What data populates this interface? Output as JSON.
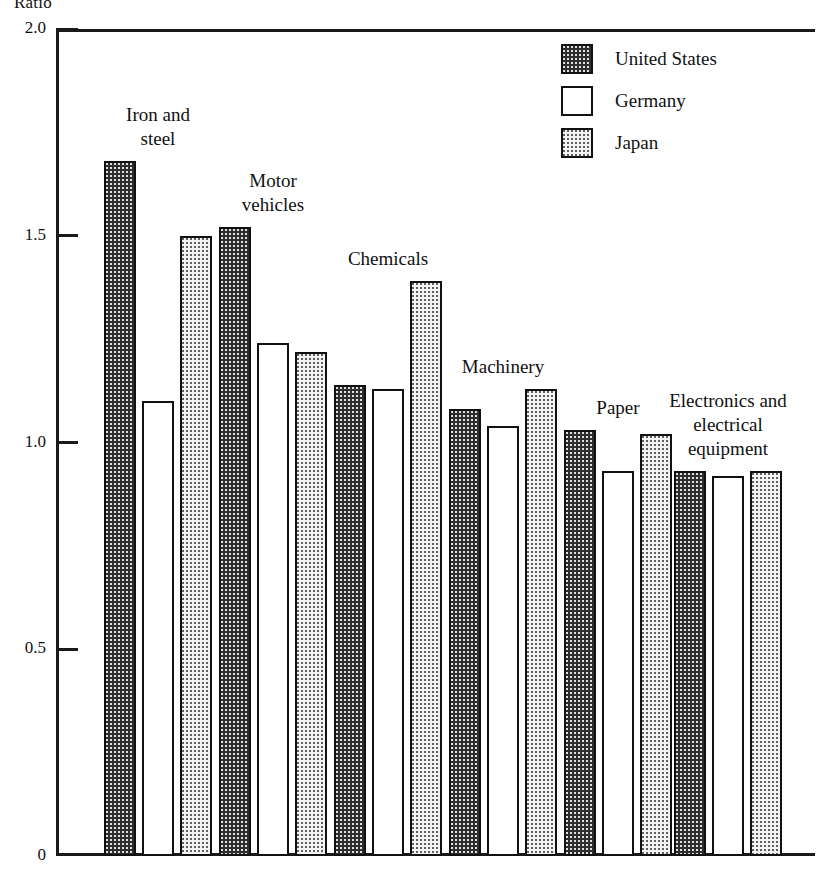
{
  "chart_data": {
    "type": "bar",
    "title": "",
    "ylabel": "Ratio",
    "xlabel": "",
    "ylim": [
      0,
      2.0
    ],
    "grid": false,
    "legend_position": "top-right",
    "y_ticks": [
      "2.0",
      "1.5",
      "1.0",
      "0.5",
      "0"
    ],
    "y_tick_values": [
      2.0,
      1.5,
      1.0,
      0.5,
      0
    ],
    "categories": [
      "Iron and\nsteel",
      "Motor\nvehicles",
      "Chemicals",
      "Machinery",
      "Paper",
      "Electronics and\nelectrical\nequipment"
    ],
    "series": [
      {
        "name": "United States",
        "values": [
          1.68,
          1.52,
          1.14,
          1.08,
          1.03,
          0.93
        ]
      },
      {
        "name": "Germany",
        "values": [
          1.1,
          1.24,
          1.13,
          1.04,
          0.93,
          0.92
        ]
      },
      {
        "name": "Japan",
        "values": [
          1.5,
          1.22,
          1.39,
          1.13,
          1.02,
          0.93
        ]
      }
    ]
  },
  "legend": {
    "items": [
      {
        "label": "United States",
        "key": "us"
      },
      {
        "label": "Germany",
        "key": "de"
      },
      {
        "label": "Japan",
        "key": "jp"
      }
    ]
  },
  "axis": {
    "y_title": "Ratio"
  }
}
